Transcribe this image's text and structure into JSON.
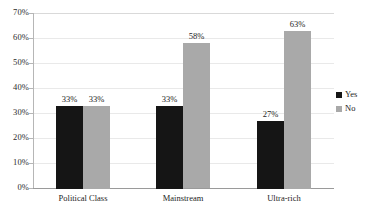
{
  "chart_data": {
    "type": "bar",
    "title": "",
    "subtitle": "",
    "xlabel": "",
    "ylabel": "",
    "categories": [
      "Political Class",
      "Mainstream",
      "Ultra-rich"
    ],
    "series": [
      {
        "name": "Yes",
        "color": "#151515",
        "values": [
          33,
          33,
          27
        ],
        "labels": [
          "33%",
          "33%",
          "27%"
        ]
      },
      {
        "name": "No",
        "color": "#a9a9a9",
        "values": [
          33,
          58,
          63
        ],
        "labels": [
          "33%",
          "58%",
          "63%"
        ]
      }
    ],
    "ylim": [
      0,
      70
    ],
    "ytick_values": [
      70,
      60,
      50,
      40,
      30,
      20,
      10,
      0
    ],
    "ytick_labels": [
      "70%",
      "60%",
      "50%",
      "40%",
      "30%",
      "20%",
      "10%",
      "0%"
    ],
    "grid": true,
    "grid_axis": "y",
    "legend_position": "right",
    "legend_entries": [
      "Yes",
      "No"
    ],
    "value_suffix": "%"
  }
}
